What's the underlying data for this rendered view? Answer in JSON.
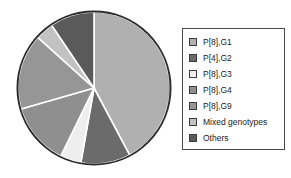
{
  "chart_data": {
    "type": "pie",
    "title": "",
    "subtitle": "",
    "xlabel": "",
    "ylabel": "",
    "grid": false,
    "legend_position": "right",
    "start_angle_deg": 0,
    "direction": "clockwise",
    "categories": [
      "P[8],G1",
      "P[4],G2",
      "P[8],G3",
      "P[8],G4",
      "P[8],G9",
      "Mixed genotypes",
      "Others"
    ],
    "values": [
      42.2,
      10.6,
      4.4,
      13.3,
      16.1,
      3.9,
      9.5
    ],
    "angles_deg": [
      152,
      38,
      16,
      48,
      58,
      14,
      34
    ],
    "colors": [
      "#b0b0b0",
      "#6b6b6b",
      "#eeeeee",
      "#8f8f8f",
      "#969696",
      "#c2c2c2",
      "#5a5a5a"
    ],
    "slice_border_color": "#ffffff",
    "outline_color": "#2b2b2b"
  },
  "legend": {
    "border_color": "#4a4a4a",
    "background": "#ffffff",
    "items": [
      {
        "label": "P[8],G1",
        "color": "#b0b0b0"
      },
      {
        "label": "P[4],G2",
        "color": "#6b6b6b"
      },
      {
        "label": "P[8],G3",
        "color": "#eeeeee"
      },
      {
        "label": "P[8],G4",
        "color": "#8f8f8f"
      },
      {
        "label": "P[8],G9",
        "color": "#969696"
      },
      {
        "label": "Mixed genotypes",
        "color": "#c2c2c2"
      },
      {
        "label": "Others",
        "color": "#5a5a5a"
      }
    ]
  }
}
